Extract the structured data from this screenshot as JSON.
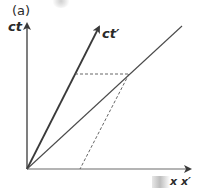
{
  "figure": {
    "panel_label": "(a)",
    "axes": {
      "ct": "ct",
      "ct_prime": "ct′",
      "x": "x x′"
    },
    "colors": {
      "line": "#3a3a3a",
      "dashed": "#555555",
      "text": "#2a2a2a"
    }
  }
}
